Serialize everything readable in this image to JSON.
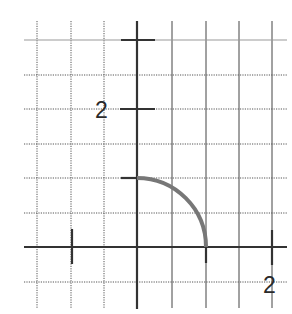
{
  "figure": {
    "type": "coordinate-plane",
    "grid": {
      "x_lines_px": [
        37,
        71,
        104,
        172,
        206,
        239,
        272
      ],
      "y_lines_px": [
        40,
        75,
        109,
        144,
        178,
        213,
        282
      ],
      "color": "#555555",
      "style": "dotted"
    },
    "axes": {
      "origin_px": [
        137,
        247
      ],
      "unit_px": 68.5,
      "color": "#333333",
      "x_axis_label": "2",
      "y_axis_label": "2"
    },
    "ticks": {
      "x": [
        -1,
        1,
        2
      ],
      "y": [
        1,
        2,
        3
      ]
    },
    "curve": {
      "shape": "quarter-circle",
      "radius": 1,
      "from": [
        0,
        1
      ],
      "to": [
        1,
        0
      ],
      "color": "#777777"
    }
  }
}
